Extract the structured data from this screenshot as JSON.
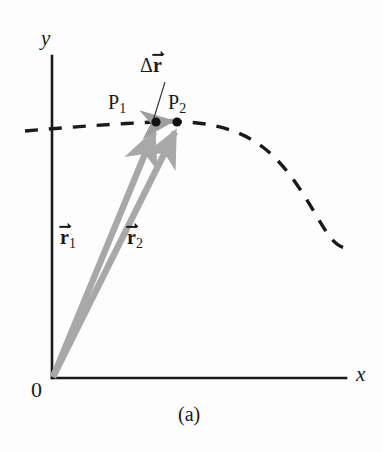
{
  "figure": {
    "caption": "(a)",
    "axes": {
      "y_label": "y",
      "x_label": "x",
      "origin_label": "0",
      "axis_color": "#1a1a1a"
    },
    "points": [
      {
        "name": "P",
        "subscript": "1",
        "label": "P",
        "x": 156,
        "y": 122
      },
      {
        "name": "P",
        "subscript": "2",
        "label": "P",
        "x": 177,
        "y": 122
      }
    ],
    "vectors": [
      {
        "id": "r1",
        "label": "r",
        "subscript": "1",
        "from": "origin",
        "to": "P1",
        "color": "#a8a8a8"
      },
      {
        "id": "r2",
        "label": "r",
        "subscript": "2",
        "from": "origin",
        "to": "P2",
        "color": "#a8a8a8"
      },
      {
        "id": "delta-r",
        "delta_symbol": "Δ",
        "label": "r",
        "subscript": "",
        "from": "P1",
        "to": "P2",
        "color": "#a8a8a8"
      }
    ],
    "trajectory": {
      "style": "dashed",
      "color": "#1a1a1a"
    },
    "colors": {
      "vector_gray": "#a8a8a8",
      "ink": "#1a1a1a",
      "background": "#fdfdfd"
    }
  }
}
